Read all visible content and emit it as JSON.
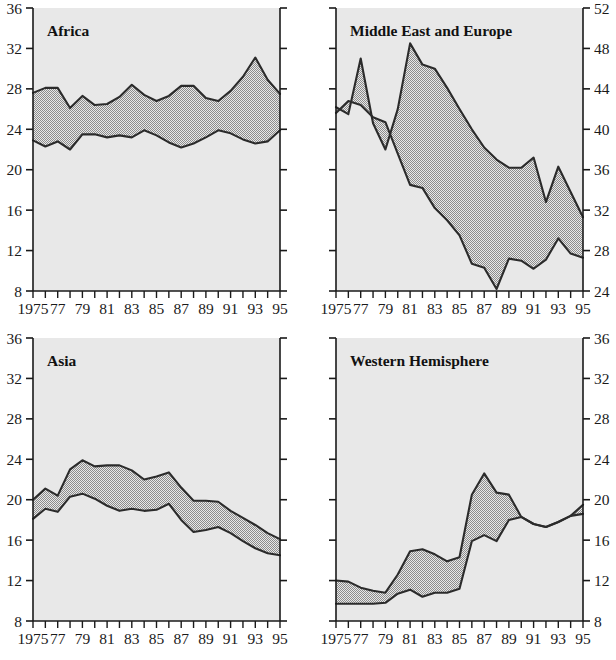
{
  "figure": {
    "layout": "2x2-panel-grid",
    "background_color": "#ffffff",
    "plot_background_color": "#e8e8e8",
    "band_fill_color": "#a8a8a8",
    "line_color": "#2b2b2b"
  },
  "panels": {
    "africa": {
      "title": "Africa"
    },
    "middle_east_europe": {
      "title": "Middle East and Europe"
    },
    "asia": {
      "title": "Asia"
    },
    "western_hemisphere": {
      "title": "Western Hemisphere"
    }
  },
  "axis": {
    "x_tick_labels": [
      "1975",
      "77",
      "79",
      "81",
      "83",
      "85",
      "87",
      "89",
      "91",
      "93",
      "95"
    ],
    "y_labels_8_36": [
      "36",
      "32",
      "28",
      "24",
      "20",
      "16",
      "12",
      "8"
    ],
    "y_labels_24_52": [
      "52",
      "48",
      "44",
      "40",
      "36",
      "32",
      "28",
      "24"
    ]
  },
  "chart_data": [
    {
      "type": "area",
      "title": "Africa",
      "panel": "top-left",
      "xlabel": "",
      "ylabel": "",
      "xlim": [
        1975,
        1995
      ],
      "ylim": [
        8,
        36
      ],
      "y_ticks": [
        8,
        12,
        16,
        20,
        24,
        28,
        32,
        36
      ],
      "y_axis_side": "left",
      "grid": false,
      "legend": "none",
      "x": [
        1975,
        1976,
        1977,
        1978,
        1979,
        1980,
        1981,
        1982,
        1983,
        1984,
        1985,
        1986,
        1987,
        1988,
        1989,
        1990,
        1991,
        1992,
        1993,
        1994,
        1995
      ],
      "series": [
        {
          "name": "upper",
          "values": [
            27.6,
            28.1,
            28.1,
            26.1,
            27.3,
            26.4,
            26.5,
            27.2,
            28.4,
            27.4,
            26.8,
            27.3,
            28.3,
            28.3,
            27.1,
            26.8,
            27.8,
            29.2,
            31.1,
            28.9,
            27.5
          ]
        },
        {
          "name": "lower",
          "values": [
            22.9,
            22.3,
            22.8,
            22.0,
            23.5,
            23.5,
            23.2,
            23.4,
            23.2,
            23.9,
            23.4,
            22.7,
            22.2,
            22.6,
            23.2,
            23.9,
            23.6,
            23.0,
            22.6,
            22.8,
            23.9
          ]
        }
      ]
    },
    {
      "type": "area",
      "title": "Middle East and Europe",
      "panel": "top-right",
      "xlabel": "",
      "ylabel": "",
      "xlim": [
        1975,
        1995
      ],
      "ylim": [
        24,
        52
      ],
      "y_ticks": [
        24,
        28,
        32,
        36,
        40,
        44,
        48,
        52
      ],
      "y_axis_side": "right",
      "grid": false,
      "legend": "none",
      "x": [
        1975,
        1976,
        1977,
        1978,
        1979,
        1980,
        1981,
        1982,
        1983,
        1984,
        1985,
        1986,
        1987,
        1988,
        1989,
        1990,
        1991,
        1992,
        1993,
        1994,
        1995
      ],
      "series": [
        {
          "name": "upper",
          "values": [
            42.2,
            41.5,
            47.0,
            40.6,
            38.0,
            42.0,
            48.5,
            46.4,
            46.0,
            44.1,
            42.0,
            40.0,
            38.2,
            37.0,
            36.2,
            36.2,
            37.2,
            32.8,
            36.3,
            33.8,
            31.3
          ]
        },
        {
          "name": "lower",
          "values": [
            41.6,
            42.8,
            42.4,
            41.2,
            40.7,
            37.6,
            34.5,
            34.2,
            32.2,
            31.0,
            29.5,
            26.7,
            26.3,
            24.2,
            27.2,
            27.0,
            26.2,
            27.1,
            29.2,
            27.7,
            27.3
          ]
        }
      ]
    },
    {
      "type": "area",
      "title": "Asia",
      "panel": "bottom-left",
      "xlabel": "",
      "ylabel": "",
      "xlim": [
        1975,
        1995
      ],
      "ylim": [
        8,
        36
      ],
      "y_ticks": [
        8,
        12,
        16,
        20,
        24,
        28,
        32,
        36
      ],
      "y_axis_side": "left",
      "grid": false,
      "legend": "none",
      "x": [
        1975,
        1976,
        1977,
        1978,
        1979,
        1980,
        1981,
        1982,
        1983,
        1984,
        1985,
        1986,
        1987,
        1988,
        1989,
        1990,
        1991,
        1992,
        1993,
        1994,
        1995
      ],
      "series": [
        {
          "name": "upper",
          "values": [
            20.0,
            21.1,
            20.4,
            23.0,
            23.9,
            23.3,
            23.4,
            23.4,
            22.9,
            22.0,
            22.3,
            22.7,
            21.2,
            19.9,
            19.9,
            19.8,
            18.9,
            18.2,
            17.5,
            16.7,
            16.1
          ]
        },
        {
          "name": "lower",
          "values": [
            18.1,
            19.1,
            18.8,
            20.3,
            20.6,
            20.1,
            19.4,
            18.9,
            19.1,
            18.9,
            19.0,
            19.6,
            18.0,
            16.8,
            17.0,
            17.3,
            16.7,
            15.9,
            15.2,
            14.7,
            14.5
          ]
        }
      ]
    },
    {
      "type": "area",
      "title": "Western Hemisphere",
      "panel": "bottom-right",
      "xlabel": "",
      "ylabel": "",
      "xlim": [
        1975,
        1995
      ],
      "ylim": [
        8,
        36
      ],
      "y_ticks": [
        8,
        12,
        16,
        20,
        24,
        28,
        32,
        36
      ],
      "y_axis_side": "right",
      "grid": false,
      "legend": "none",
      "x": [
        1975,
        1976,
        1977,
        1978,
        1979,
        1980,
        1981,
        1982,
        1983,
        1984,
        1985,
        1986,
        1987,
        1988,
        1989,
        1990,
        1991,
        1992,
        1993,
        1994,
        1995
      ],
      "series": [
        {
          "name": "upper",
          "values": [
            12.0,
            11.9,
            11.3,
            11.0,
            10.8,
            12.6,
            14.9,
            15.1,
            14.6,
            13.9,
            14.3,
            20.5,
            22.6,
            20.7,
            20.5,
            18.3,
            17.6,
            17.3,
            17.8,
            18.4,
            19.5
          ]
        },
        {
          "name": "lower",
          "values": [
            9.7,
            9.7,
            9.7,
            9.7,
            9.8,
            10.7,
            11.1,
            10.4,
            10.8,
            10.8,
            11.2,
            15.9,
            16.5,
            15.9,
            18.0,
            18.3,
            17.6,
            17.3,
            17.8,
            18.4,
            18.6
          ]
        }
      ]
    }
  ]
}
